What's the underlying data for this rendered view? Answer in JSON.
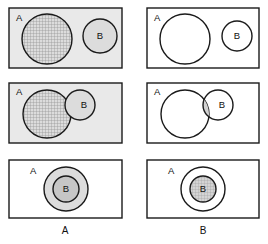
{
  "figure": {
    "width": 268,
    "height": 244,
    "background_color": "#ffffff",
    "outline_color": "#1a1a1a"
  },
  "palette": {
    "white": "#ffffff",
    "panel_shade": "#e9e9e9",
    "circle_shade_light": "#dcdcdc",
    "circle_shade_mid": "#cfcfcf",
    "circle_shade_dark": "#c2c2c2",
    "hatch_line": "#8c8c8c",
    "outline": "#1a1a1a",
    "text": "#101010"
  },
  "columns": [
    {
      "id": "left",
      "caption": "A",
      "caption_x": 65,
      "caption_y": 231
    },
    {
      "id": "right",
      "caption": "B",
      "caption_x": 203,
      "caption_y": 231
    }
  ],
  "panels": [
    {
      "id": "r1c1",
      "row": 1,
      "column": "left",
      "relation": "disjoint",
      "shaded_set": "A",
      "rect": {
        "x": 9,
        "y": 8,
        "w": 113,
        "h": 60,
        "fill": "#e9e9e9"
      },
      "label_a": {
        "text": "A",
        "x": 16,
        "y": 18
      },
      "circle_a": {
        "cx": 47,
        "cy": 39,
        "r": 25,
        "fill": "#dcdcdc",
        "hatched": true
      },
      "circle_b": {
        "cx": 100,
        "cy": 36,
        "r": 17,
        "fill": "#dcdcdc",
        "hatched": false
      },
      "label_b": {
        "text": "B",
        "x": 100,
        "y": 36
      }
    },
    {
      "id": "r1c2",
      "row": 1,
      "column": "right",
      "relation": "disjoint",
      "shaded_set": "B",
      "rect": {
        "x": 147,
        "y": 8,
        "w": 112,
        "h": 60,
        "fill": "#ffffff"
      },
      "label_a": {
        "text": "A",
        "x": 154,
        "y": 18
      },
      "circle_a": {
        "cx": 185,
        "cy": 39,
        "r": 25,
        "fill": "#ffffff",
        "hatched": false
      },
      "circle_b": {
        "cx": 237,
        "cy": 36,
        "r": 15,
        "fill": "#ffffff",
        "hatched": false
      },
      "label_b": {
        "text": "B",
        "x": 237,
        "y": 36
      }
    },
    {
      "id": "r2c1",
      "row": 2,
      "column": "left",
      "relation": "overlapping",
      "shaded_set": "A",
      "rect": {
        "x": 9,
        "y": 83,
        "w": 113,
        "h": 60,
        "fill": "#e9e9e9"
      },
      "label_a": {
        "text": "A",
        "x": 16,
        "y": 92
      },
      "circle_a": {
        "cx": 47,
        "cy": 114,
        "r": 24,
        "fill": "#dcdcdc",
        "hatched": true
      },
      "circle_b": {
        "cx": 80,
        "cy": 105,
        "r": 15,
        "fill": "#dcdcdc",
        "hatched": false
      },
      "label_b": {
        "text": "B",
        "x": 84,
        "y": 105
      }
    },
    {
      "id": "r2c2",
      "row": 2,
      "column": "right",
      "relation": "overlapping",
      "shaded_set": "B",
      "rect": {
        "x": 147,
        "y": 83,
        "w": 112,
        "h": 60,
        "fill": "#ffffff"
      },
      "label_a": {
        "text": "A",
        "x": 154,
        "y": 92
      },
      "circle_a": {
        "cx": 185,
        "cy": 114,
        "r": 24,
        "fill": "#ffffff",
        "hatched": false
      },
      "circle_b": {
        "cx": 218,
        "cy": 105,
        "r": 15,
        "fill": "#ffffff",
        "hatched": false
      },
      "label_b": {
        "text": "B",
        "x": 222,
        "y": 105
      },
      "intersection_shaded": true,
      "intersection_fill": "#d2d2d2"
    },
    {
      "id": "r3c1",
      "row": 3,
      "column": "left",
      "relation": "subset",
      "shaded_set": "A",
      "rect": {
        "x": 9,
        "y": 160,
        "w": 113,
        "h": 58,
        "fill": "#ffffff"
      },
      "label_a": {
        "text": "A",
        "x": 30,
        "y": 171
      },
      "circle_a": {
        "cx": 66,
        "cy": 189,
        "r": 22,
        "fill": "#dcdcdc",
        "hatched": false
      },
      "circle_b": {
        "cx": 66,
        "cy": 189,
        "r": 13,
        "fill": "#c6c6c6",
        "hatched": false
      },
      "label_b": {
        "text": "B",
        "x": 66,
        "y": 189
      }
    },
    {
      "id": "r3c2",
      "row": 3,
      "column": "right",
      "relation": "subset",
      "shaded_set": "B",
      "rect": {
        "x": 147,
        "y": 160,
        "w": 112,
        "h": 58,
        "fill": "#ffffff"
      },
      "label_a": {
        "text": "A",
        "x": 168,
        "y": 171
      },
      "circle_a": {
        "cx": 203,
        "cy": 189,
        "r": 22,
        "fill": "#ffffff",
        "hatched": false
      },
      "circle_b": {
        "cx": 203,
        "cy": 189,
        "r": 13,
        "fill": "#cfcfcf",
        "hatched": true
      },
      "label_b": {
        "text": "B",
        "x": 203,
        "y": 189
      }
    }
  ]
}
